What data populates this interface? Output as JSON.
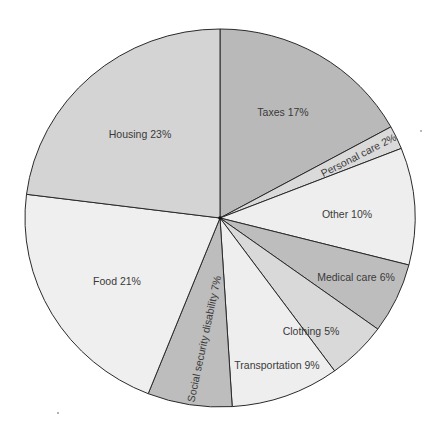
{
  "chart_data": {
    "type": "pie",
    "title": "",
    "start_angle_deg": 0,
    "direction": "clockwise",
    "categories": [
      "Taxes",
      "Personal care",
      "Other",
      "Medical care",
      "Clothing",
      "Transportation",
      "Social security disability",
      "Food",
      "Housing"
    ],
    "values": [
      17,
      2,
      10,
      6,
      5,
      9,
      7,
      21,
      23
    ],
    "unit": "%",
    "slices": [
      {
        "name": "Taxes",
        "value": 17,
        "label": "Taxes 17%",
        "color": "#b9b9b9",
        "label_x": 283,
        "label_y": 113,
        "rotate": 0
      },
      {
        "name": "Personal care",
        "value": 2,
        "label": "Personal care 2%",
        "color": "#dadada",
        "label_x": 359,
        "label_y": 156,
        "rotate": -27
      },
      {
        "name": "Other",
        "value": 10,
        "label": "Other 10%",
        "color": "#eeeeee",
        "label_x": 347,
        "label_y": 215,
        "rotate": 0
      },
      {
        "name": "Medical care",
        "value": 6,
        "label": "Medical care 6%",
        "color": "#bdbdbd",
        "label_x": 356,
        "label_y": 278,
        "rotate": 0
      },
      {
        "name": "Clothing",
        "value": 5,
        "label": "Clothing 5%",
        "color": "#d9d9d9",
        "label_x": 311,
        "label_y": 332,
        "rotate": 0
      },
      {
        "name": "Transportation",
        "value": 9,
        "label": "Transportation 9%",
        "color": "#eeeeee",
        "label_x": 277,
        "label_y": 366,
        "rotate": 0
      },
      {
        "name": "Social security disability",
        "value": 7,
        "label": "Social security disability 7%",
        "color": "#bdbdbd",
        "label_x": 205,
        "label_y": 339,
        "rotate": -78
      },
      {
        "name": "Food",
        "value": 21,
        "label": "Food 21%",
        "color": "#efefef",
        "label_x": 117,
        "label_y": 282,
        "rotate": 0
      },
      {
        "name": "Housing",
        "value": 23,
        "label": "Housing 23%",
        "color": "#d4d4d4",
        "label_x": 140,
        "label_y": 135,
        "rotate": 0
      }
    ],
    "geometry": {
      "cx": 220,
      "cy": 218,
      "rx": 195,
      "ry": 189
    },
    "legend": "none",
    "grid": false
  }
}
